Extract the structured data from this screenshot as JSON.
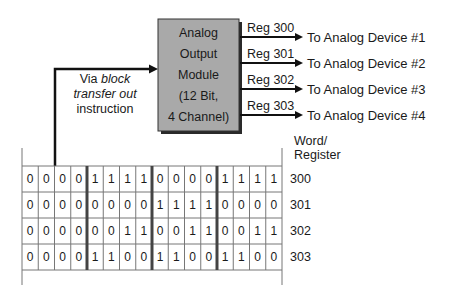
{
  "module": {
    "lines": [
      "Analog",
      "Output",
      "Module",
      "(12 Bit,",
      "4 Channel)"
    ],
    "fill_color": "#a9a9a9"
  },
  "input": {
    "prefix": "Via",
    "italic_1": "block",
    "italic_2": "transfer out",
    "suffix": "instruction"
  },
  "outputs": [
    {
      "reg": "Reg 300",
      "device": "To Analog Device #1"
    },
    {
      "reg": "Reg 301",
      "device": "To Analog Device #2"
    },
    {
      "reg": "Reg 302",
      "device": "To Analog Device #3"
    },
    {
      "reg": "Reg 303",
      "device": "To Analog Device #4"
    }
  ],
  "table": {
    "header_line1": "Word/",
    "header_line2": "Register",
    "rows": [
      {
        "register": "300",
        "bits": [
          "0",
          "0",
          "0",
          "0",
          "1",
          "1",
          "1",
          "1",
          "0",
          "0",
          "0",
          "0",
          "1",
          "1",
          "1",
          "1"
        ]
      },
      {
        "register": "301",
        "bits": [
          "0",
          "0",
          "0",
          "0",
          "0",
          "0",
          "0",
          "0",
          "1",
          "1",
          "1",
          "1",
          "0",
          "0",
          "0",
          "0"
        ]
      },
      {
        "register": "302",
        "bits": [
          "0",
          "0",
          "0",
          "0",
          "0",
          "0",
          "1",
          "1",
          "0",
          "0",
          "1",
          "1",
          "0",
          "0",
          "1",
          "1"
        ]
      },
      {
        "register": "303",
        "bits": [
          "0",
          "0",
          "0",
          "0",
          "1",
          "1",
          "0",
          "0",
          "1",
          "1",
          "0",
          "0",
          "1",
          "1",
          "0",
          "0"
        ]
      }
    ]
  }
}
